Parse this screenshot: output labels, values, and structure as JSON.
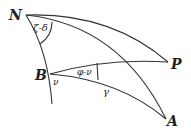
{
  "diagram": {
    "type": "spherical-triangle",
    "points": {
      "N": {
        "label": "N"
      },
      "P": {
        "label": "P"
      },
      "B": {
        "label": "B"
      },
      "A": {
        "label": "A"
      }
    },
    "angles": {
      "at_N": "ζ-δ",
      "at_B_lower": "ν",
      "at_B_upper": "φ-ν"
    },
    "arcs": {
      "B_to_A": "γ"
    }
  }
}
